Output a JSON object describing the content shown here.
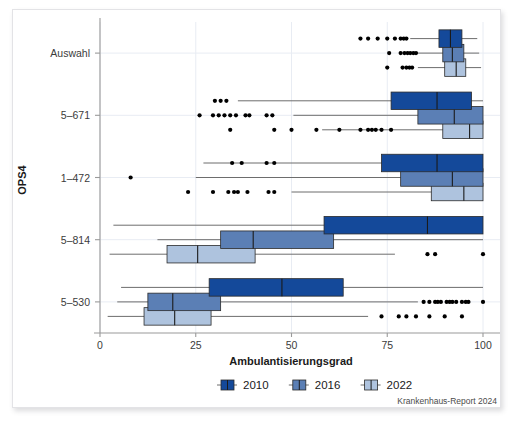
{
  "figure": {
    "source_note": "Krankenhaus-Report 2024",
    "background": "#ffffff"
  },
  "legend": {
    "position": "bottom-center",
    "items": [
      {
        "label": "2010",
        "color": "#14499a"
      },
      {
        "label": "2016",
        "color": "#5b7fb5"
      },
      {
        "label": "2022",
        "color": "#aec3de"
      }
    ]
  },
  "chart_data": {
    "type": "boxplot",
    "title": "",
    "subtitle": "",
    "xlabel": "Ambulantisierungsgrad",
    "ylabel": "OPS4",
    "xlim": [
      0,
      105
    ],
    "ylim": [
      0,
      5
    ],
    "xticks": [
      0,
      25,
      50,
      75,
      100
    ],
    "xticklabels": [
      "0",
      "25",
      "50",
      "75",
      "100"
    ],
    "categories": [
      "Auswahl",
      "5–671",
      "1–472",
      "5–814",
      "5–530"
    ],
    "grid": "vertical-light",
    "orientation": "horizontal",
    "series": [
      {
        "name": "2010",
        "color": "#14499a",
        "boxes": [
          {
            "category": "Auswahl",
            "whisker_low": 81.0,
            "q1": 88.5,
            "median": 91.5,
            "q3": 94.5,
            "whisker_high": 98.5,
            "outliers": [
              68.0,
              70.0,
              72.5,
              75.0,
              77.0,
              78.5,
              79.3,
              80.0
            ]
          },
          {
            "category": "5–671",
            "whisker_low": 36.0,
            "q1": 76.0,
            "median": 88.0,
            "q3": 97.0,
            "whisker_high": 100.0,
            "outliers": [
              30.0,
              31.5,
              33.0
            ]
          },
          {
            "category": "1–472",
            "whisker_low": 27.0,
            "q1": 73.5,
            "median": 88.0,
            "q3": 100.0,
            "whisker_high": 100.0,
            "outliers": [
              34.5,
              37.0,
              43.5,
              45.5
            ]
          },
          {
            "category": "5–814",
            "whisker_low": 3.5,
            "q1": 58.5,
            "median": 85.5,
            "q3": 100.0,
            "whisker_high": 100.0,
            "outliers": []
          },
          {
            "category": "5–530",
            "whisker_low": 5.5,
            "q1": 28.5,
            "median": 47.5,
            "q3": 63.5,
            "whisker_high": 100.0,
            "outliers": []
          }
        ]
      },
      {
        "name": "2016",
        "color": "#5b7fb5",
        "boxes": [
          {
            "category": "Auswahl",
            "whisker_low": 82.0,
            "q1": 89.5,
            "median": 92.0,
            "q3": 95.0,
            "whisker_high": 99.0,
            "outliers": [
              75.5,
              78.5,
              79.5,
              80.3,
              81.0,
              81.8,
              82.5
            ]
          },
          {
            "category": "5–671",
            "whisker_low": 50.5,
            "q1": 83.0,
            "median": 92.5,
            "q3": 100.0,
            "whisker_high": 100.0,
            "outliers": [
              26.0,
              29.5,
              31.0,
              32.5,
              34.0,
              35.5,
              38.0,
              39.0,
              43.5,
              45.0
            ]
          },
          {
            "category": "1–472",
            "whisker_low": 25.0,
            "q1": 78.5,
            "median": 92.0,
            "q3": 100.0,
            "whisker_high": 100.0,
            "outliers": [
              8.0
            ]
          },
          {
            "category": "5–814",
            "whisker_low": 15.0,
            "q1": 31.5,
            "median": 40.0,
            "q3": 61.0,
            "whisker_high": 100.0,
            "outliers": []
          },
          {
            "category": "5–530",
            "whisker_low": 4.5,
            "q1": 12.5,
            "median": 19.0,
            "q3": 31.5,
            "whisker_high": 83.0,
            "outliers": [
              84.5,
              86.0,
              87.5,
              88.2,
              89.0,
              90.5,
              91.3,
              92.0,
              93.0,
              94.5,
              95.5,
              96.2,
              100.0
            ]
          }
        ]
      },
      {
        "name": "2022",
        "color": "#aec3de",
        "boxes": [
          {
            "category": "Auswahl",
            "whisker_low": 83.0,
            "q1": 90.0,
            "median": 93.0,
            "q3": 95.5,
            "whisker_high": 99.5,
            "outliers": [
              75.0,
              79.0,
              80.0,
              80.8,
              81.5
            ]
          },
          {
            "category": "5–671",
            "whisker_low": 58.0,
            "q1": 89.5,
            "median": 96.5,
            "q3": 100.0,
            "whisker_high": 100.0,
            "outliers": [
              34.0,
              45.5,
              50.0,
              56.5,
              62.5,
              68.0,
              70.0,
              71.0,
              72.0,
              73.5,
              76.0
            ]
          },
          {
            "category": "1–472",
            "whisker_low": 50.0,
            "q1": 86.5,
            "median": 95.0,
            "q3": 100.0,
            "whisker_high": 100.0,
            "outliers": [
              23.0,
              29.5,
              33.5,
              35.0,
              36.0,
              38.5,
              44.0,
              45.5
            ]
          },
          {
            "category": "5–814",
            "whisker_low": 2.5,
            "q1": 17.5,
            "median": 25.5,
            "q3": 40.5,
            "whisker_high": 77.0,
            "outliers": [
              85.5,
              87.5,
              100.0
            ]
          },
          {
            "category": "5–530",
            "whisker_low": 2.0,
            "q1": 11.5,
            "median": 19.5,
            "q3": 29.0,
            "whisker_high": 70.0,
            "outliers": [
              73.5,
              78.0,
              80.0,
              82.5,
              86.0,
              90.0,
              94.5
            ]
          }
        ]
      }
    ]
  }
}
